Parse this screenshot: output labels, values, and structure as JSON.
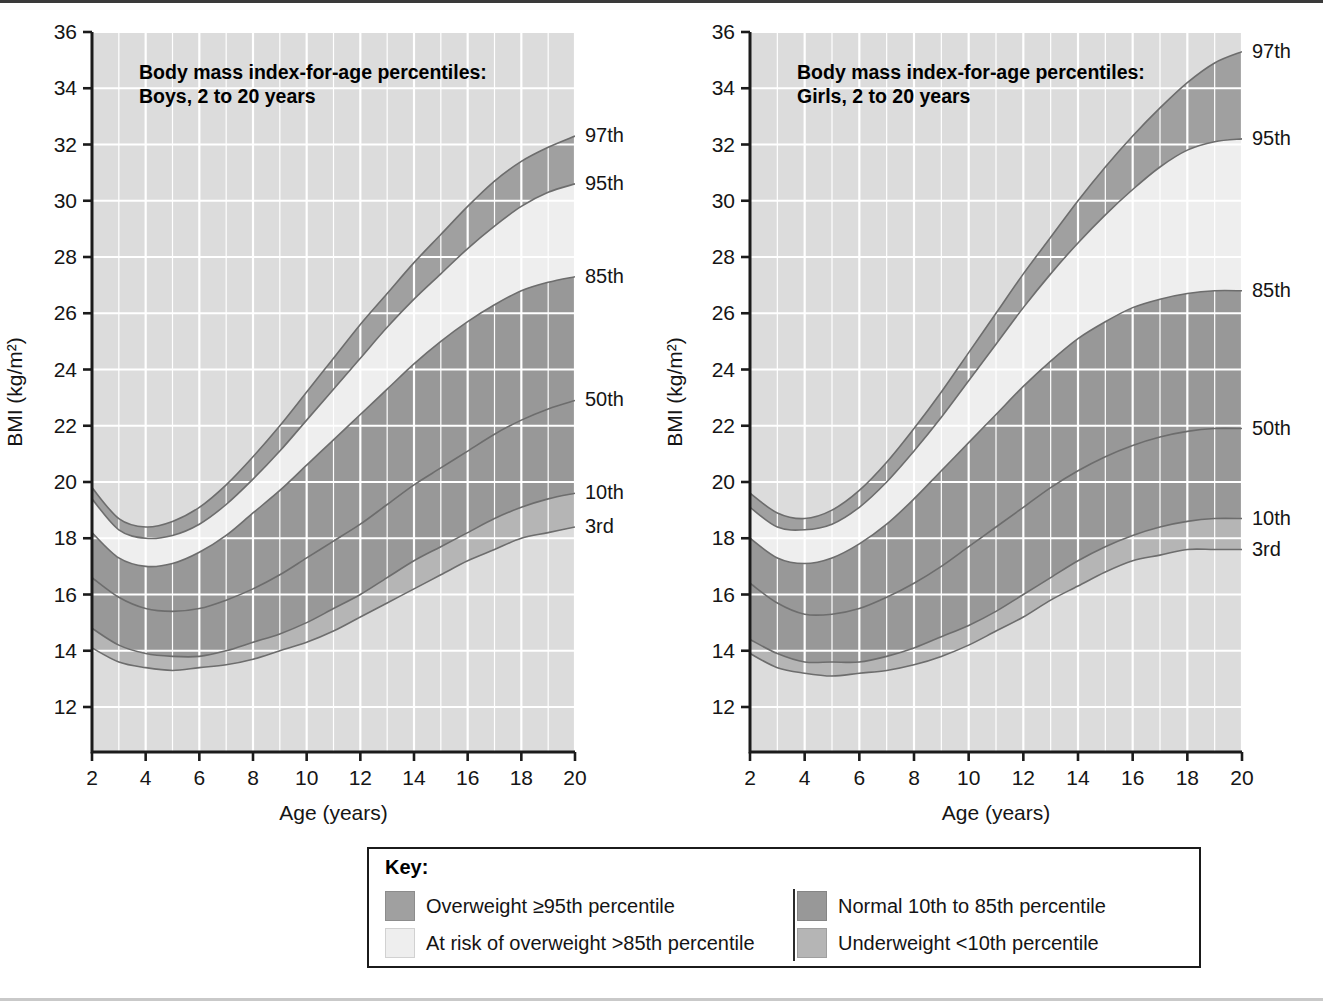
{
  "figure": {
    "top_rule_color": "#3a3a3a",
    "bottom_rule_color": "#c9c9c9"
  },
  "palette": {
    "plot_background": "#dcdcdc",
    "gridline": "#ffffff",
    "axis": "#1b1b1b",
    "band_overweight": "#a0a0a0",
    "band_at_risk": "#eeeeee",
    "band_normal": "#989898",
    "band_underweight": "#b5b5b5",
    "curve_line": "#6d6d6d",
    "text": "#141414"
  },
  "charts": [
    {
      "id": "boys",
      "title_line1": "Body mass index-for-age percentiles:",
      "title_line2": "Boys, 2 to 20 years",
      "xlabel": "Age (years)",
      "ylabel": "BMI (kg/m²)",
      "xlim": [
        2,
        20
      ],
      "ylim": [
        10.4,
        36
      ],
      "xticks": [
        2,
        4,
        6,
        8,
        10,
        12,
        14,
        16,
        18,
        20
      ],
      "xticklabels": [
        "2",
        "4",
        "6",
        "8",
        "10",
        "12",
        "14",
        "16",
        "18",
        "20"
      ],
      "yticks": [
        12,
        14,
        16,
        18,
        20,
        22,
        24,
        26,
        28,
        30,
        32,
        34,
        36
      ],
      "yticklabels": [
        "12",
        "14",
        "16",
        "18",
        "20",
        "22",
        "24",
        "26",
        "28",
        "30",
        "32",
        "34",
        "36"
      ],
      "minor_x_step": 1,
      "grid": true,
      "percentile_labels": [
        "97th",
        "95th",
        "85th",
        "50th",
        "10th",
        "3rd"
      ],
      "x": [
        2,
        3,
        4,
        5,
        6,
        7,
        8,
        9,
        10,
        11,
        12,
        13,
        14,
        15,
        16,
        17,
        18,
        19,
        20
      ],
      "series": [
        {
          "name": "97th",
          "values": [
            19.8,
            18.7,
            18.4,
            18.6,
            19.1,
            19.9,
            20.9,
            22.0,
            23.2,
            24.4,
            25.6,
            26.7,
            27.8,
            28.8,
            29.8,
            30.7,
            31.4,
            31.9,
            32.3
          ]
        },
        {
          "name": "95th",
          "values": [
            19.4,
            18.3,
            18.0,
            18.1,
            18.5,
            19.2,
            20.1,
            21.1,
            22.2,
            23.3,
            24.4,
            25.5,
            26.5,
            27.4,
            28.3,
            29.1,
            29.8,
            30.3,
            30.6
          ]
        },
        {
          "name": "85th",
          "values": [
            18.2,
            17.3,
            17.0,
            17.1,
            17.5,
            18.1,
            18.9,
            19.7,
            20.6,
            21.5,
            22.4,
            23.3,
            24.2,
            25.0,
            25.7,
            26.3,
            26.8,
            27.1,
            27.3
          ]
        },
        {
          "name": "50th",
          "values": [
            16.6,
            15.9,
            15.5,
            15.4,
            15.5,
            15.8,
            16.2,
            16.7,
            17.3,
            17.9,
            18.5,
            19.2,
            19.9,
            20.5,
            21.1,
            21.7,
            22.2,
            22.6,
            22.9
          ]
        },
        {
          "name": "10th",
          "values": [
            14.8,
            14.2,
            13.9,
            13.8,
            13.8,
            14.0,
            14.3,
            14.6,
            15.0,
            15.5,
            16.0,
            16.6,
            17.2,
            17.7,
            18.2,
            18.7,
            19.1,
            19.4,
            19.6
          ]
        },
        {
          "name": "3rd",
          "values": [
            14.1,
            13.6,
            13.4,
            13.3,
            13.4,
            13.5,
            13.7,
            14.0,
            14.3,
            14.7,
            15.2,
            15.7,
            16.2,
            16.7,
            17.2,
            17.6,
            18.0,
            18.2,
            18.4
          ]
        }
      ]
    },
    {
      "id": "girls",
      "title_line1": "Body mass index-for-age percentiles:",
      "title_line2": "Girls, 2 to 20 years",
      "xlabel": "Age (years)",
      "ylabel": "BMI (kg/m²)",
      "xlim": [
        2,
        20
      ],
      "ylim": [
        10.4,
        36
      ],
      "xticks": [
        2,
        4,
        6,
        8,
        10,
        12,
        14,
        16,
        18,
        20
      ],
      "xticklabels": [
        "2",
        "4",
        "6",
        "8",
        "10",
        "12",
        "14",
        "16",
        "18",
        "20"
      ],
      "yticks": [
        12,
        14,
        16,
        18,
        20,
        22,
        24,
        26,
        28,
        30,
        32,
        34,
        36
      ],
      "yticklabels": [
        "12",
        "14",
        "16",
        "18",
        "20",
        "22",
        "24",
        "26",
        "28",
        "30",
        "32",
        "34",
        "36"
      ],
      "minor_x_step": 1,
      "grid": true,
      "percentile_labels": [
        "97th",
        "95th",
        "85th",
        "50th",
        "10th",
        "3rd"
      ],
      "x": [
        2,
        3,
        4,
        5,
        6,
        7,
        8,
        9,
        10,
        11,
        12,
        13,
        14,
        15,
        16,
        17,
        18,
        19,
        20
      ],
      "series": [
        {
          "name": "97th",
          "values": [
            19.6,
            18.9,
            18.7,
            19.0,
            19.7,
            20.7,
            21.9,
            23.2,
            24.6,
            26.0,
            27.4,
            28.7,
            30.0,
            31.2,
            32.3,
            33.3,
            34.2,
            34.9,
            35.3
          ]
        },
        {
          "name": "95th",
          "values": [
            19.1,
            18.4,
            18.3,
            18.5,
            19.1,
            20.0,
            21.1,
            22.3,
            23.6,
            24.9,
            26.2,
            27.4,
            28.5,
            29.5,
            30.4,
            31.2,
            31.8,
            32.1,
            32.2
          ]
        },
        {
          "name": "85th",
          "values": [
            18.0,
            17.3,
            17.1,
            17.3,
            17.8,
            18.5,
            19.4,
            20.4,
            21.4,
            22.4,
            23.4,
            24.3,
            25.1,
            25.7,
            26.2,
            26.5,
            26.7,
            26.8,
            26.8
          ]
        },
        {
          "name": "50th",
          "values": [
            16.4,
            15.7,
            15.3,
            15.3,
            15.5,
            15.9,
            16.4,
            17.0,
            17.7,
            18.4,
            19.1,
            19.8,
            20.4,
            20.9,
            21.3,
            21.6,
            21.8,
            21.9,
            21.9
          ]
        },
        {
          "name": "10th",
          "values": [
            14.4,
            13.9,
            13.6,
            13.6,
            13.6,
            13.8,
            14.1,
            14.5,
            14.9,
            15.4,
            16.0,
            16.6,
            17.2,
            17.7,
            18.1,
            18.4,
            18.6,
            18.7,
            18.7
          ]
        },
        {
          "name": "3rd",
          "values": [
            13.9,
            13.4,
            13.2,
            13.1,
            13.2,
            13.3,
            13.5,
            13.8,
            14.2,
            14.7,
            15.2,
            15.8,
            16.3,
            16.8,
            17.2,
            17.4,
            17.6,
            17.6,
            17.6
          ]
        }
      ]
    }
  ],
  "key": {
    "title": "Key:",
    "left_items": [
      {
        "label": "Overweight ≥95th percentile",
        "color": "#a0a0a0"
      },
      {
        "label": "At risk of overweight >85th percentile",
        "color": "#eeeeee"
      }
    ],
    "right_items": [
      {
        "label": "Normal 10th to 85th percentile",
        "color": "#989898"
      },
      {
        "label": "Underweight <10th percentile",
        "color": "#b5b5b5"
      }
    ]
  }
}
